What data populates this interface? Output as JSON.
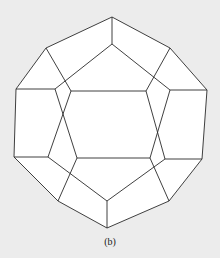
{
  "figure": {
    "caption": "(b)",
    "colors": {
      "background": "#ececec",
      "face": "#ffffff",
      "edge": "#2a2a2a"
    }
  },
  "vertices": {
    "o1": [
      112,
      17
    ],
    "o2": [
      170,
      48
    ],
    "o3": [
      207,
      90
    ],
    "o4": [
      202,
      159
    ],
    "o5": [
      169,
      201
    ],
    "o6": [
      107,
      228
    ],
    "o7": [
      58,
      201
    ],
    "o8": [
      14,
      157
    ],
    "o9": [
      16,
      89
    ],
    "o10": [
      46,
      48
    ],
    "f1": [
      112,
      44
    ],
    "f2": [
      170,
      90
    ],
    "f3": [
      150,
      158
    ],
    "f4": [
      77,
      158
    ],
    "f5": [
      55,
      89
    ],
    "b1": [
      71,
      91
    ],
    "b2": [
      146,
      91
    ],
    "b3": [
      165,
      159
    ],
    "b4": [
      107,
      201
    ],
    "b5": [
      48,
      157
    ]
  },
  "edges": [
    [
      "o1",
      "o2"
    ],
    [
      "o2",
      "o3"
    ],
    [
      "o3",
      "o4"
    ],
    [
      "o4",
      "o5"
    ],
    [
      "o5",
      "o6"
    ],
    [
      "o6",
      "o7"
    ],
    [
      "o7",
      "o8"
    ],
    [
      "o8",
      "o9"
    ],
    [
      "o9",
      "o10"
    ],
    [
      "o10",
      "o1"
    ],
    [
      "o1",
      "f1"
    ],
    [
      "f1",
      "f2"
    ],
    [
      "f2",
      "f3"
    ],
    [
      "f3",
      "f4"
    ],
    [
      "f4",
      "f5"
    ],
    [
      "f5",
      "f1"
    ],
    [
      "o3",
      "f2"
    ],
    [
      "o9",
      "f5"
    ],
    [
      "o5",
      "f3"
    ],
    [
      "o7",
      "f4"
    ],
    [
      "o2",
      "b2"
    ],
    [
      "o10",
      "b1"
    ],
    [
      "b1",
      "b2"
    ],
    [
      "b2",
      "b3"
    ],
    [
      "b1",
      "b5"
    ],
    [
      "b5",
      "b4"
    ],
    [
      "b3",
      "b4"
    ],
    [
      "b3",
      "o4"
    ],
    [
      "b5",
      "o8"
    ],
    [
      "b4",
      "o6"
    ]
  ]
}
